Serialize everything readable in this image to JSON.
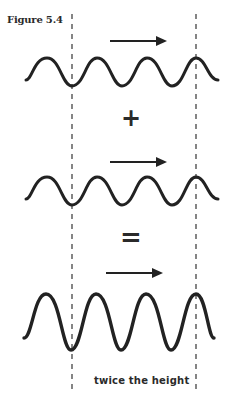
{
  "figure": {
    "label": "Figure 5.4",
    "operators": {
      "plus": "+",
      "equals": "="
    },
    "caption": "twice the height",
    "colors": {
      "ink": "#222222",
      "dash": "#444444",
      "background": "#ffffff"
    },
    "waves": [
      {
        "name": "wave-1",
        "amplitude": 14,
        "baseline_y": 72,
        "arrow": "right"
      },
      {
        "name": "wave-2",
        "amplitude": 14,
        "baseline_y": 191,
        "arrow": "right"
      },
      {
        "name": "wave-3-sum",
        "amplitude": 28,
        "baseline_y": 322,
        "arrow": "right"
      }
    ],
    "reference_lines": [
      "dashed-left",
      "dashed-right"
    ]
  }
}
